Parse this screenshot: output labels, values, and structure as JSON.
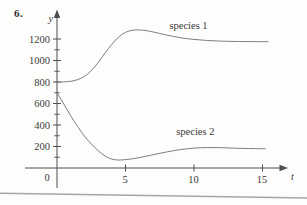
{
  "problem_number": "6.",
  "colors": {
    "curve": "#7d7d7d",
    "axis": "#4d4d4d",
    "text": "#3a3a3a",
    "rule_line": "#a6a6a6",
    "background": "#fdfdfc"
  },
  "chart_data": {
    "type": "line",
    "title": "",
    "xlabel": "t",
    "ylabel": "y",
    "origin_label": "0",
    "xlim": [
      0,
      16
    ],
    "ylim": [
      0,
      1350
    ],
    "grid": false,
    "legend_position": "inline-annotations",
    "x_ticks": [
      5,
      10,
      15
    ],
    "y_ticks_labeled": [
      200,
      400,
      600,
      800,
      1000,
      1200
    ],
    "y_ticks_minor": [
      100,
      300,
      500,
      700,
      900,
      1100
    ],
    "series": [
      {
        "name": "species 1",
        "label": "species 1",
        "label_anchor": {
          "t": 9.6,
          "y": 1330
        },
        "points": [
          [
            0,
            800
          ],
          [
            0.5,
            801
          ],
          [
            1,
            807
          ],
          [
            1.5,
            822
          ],
          [
            2,
            852
          ],
          [
            2.5,
            905
          ],
          [
            3,
            980
          ],
          [
            3.5,
            1068
          ],
          [
            4,
            1150
          ],
          [
            4.5,
            1218
          ],
          [
            5,
            1262
          ],
          [
            5.5,
            1281
          ],
          [
            6,
            1284
          ],
          [
            6.5,
            1278
          ],
          [
            7,
            1266
          ],
          [
            8,
            1237
          ],
          [
            9,
            1212
          ],
          [
            10,
            1196
          ],
          [
            11,
            1186
          ],
          [
            12,
            1180
          ],
          [
            13,
            1177
          ],
          [
            14,
            1176
          ],
          [
            15.4,
            1175
          ]
        ]
      },
      {
        "name": "species 2",
        "label": "species 2",
        "label_anchor": {
          "t": 10.1,
          "y": 335
        },
        "points": [
          [
            0,
            700
          ],
          [
            0.5,
            594
          ],
          [
            1,
            486
          ],
          [
            1.5,
            386
          ],
          [
            2,
            298
          ],
          [
            2.5,
            224
          ],
          [
            3,
            162
          ],
          [
            3.5,
            112
          ],
          [
            4,
            83
          ],
          [
            4.5,
            74
          ],
          [
            5,
            78
          ],
          [
            5.5,
            86
          ],
          [
            6,
            97
          ],
          [
            7,
            123
          ],
          [
            8,
            149
          ],
          [
            9,
            171
          ],
          [
            10,
            185
          ],
          [
            11,
            190
          ],
          [
            12,
            189
          ],
          [
            13,
            184
          ],
          [
            14,
            181
          ],
          [
            15.2,
            179
          ]
        ]
      }
    ]
  }
}
